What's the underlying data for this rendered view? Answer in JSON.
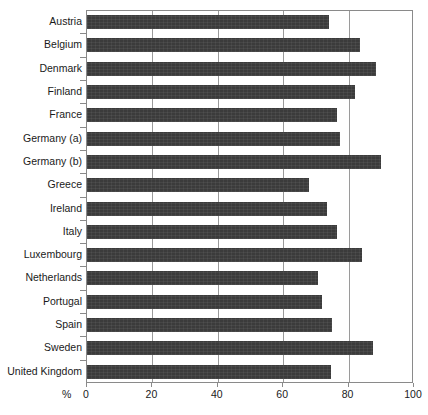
{
  "chart_data": {
    "type": "bar",
    "orientation": "horizontal",
    "title": "",
    "subtitle": "",
    "xlabel": "%",
    "ylabel": "",
    "xlim": [
      0,
      100
    ],
    "grid": true,
    "legend": false,
    "xticks": [
      0,
      20,
      40,
      60,
      80,
      100
    ],
    "xticklabels": [
      "0",
      "20",
      "40",
      "60",
      "80",
      "100"
    ],
    "categories": [
      "Austria",
      "Belgium",
      "Denmark",
      "Finland",
      "France",
      "Germany (a)",
      "Germany (b)",
      "Greece",
      "Ireland",
      "Italy",
      "Luxembourg",
      "Netherlands",
      "Portugal",
      "Spain",
      "Sweden",
      "United Kingdom"
    ],
    "values": [
      74,
      83.5,
      88.5,
      82,
      76.5,
      77.5,
      90,
      68,
      73.5,
      76.5,
      84,
      70.5,
      72,
      75,
      87.5,
      74.5
    ],
    "bar_color": "#3b3b3b",
    "axis_color": "#8a8a8a",
    "gridline_color": "#9a9a9a"
  }
}
